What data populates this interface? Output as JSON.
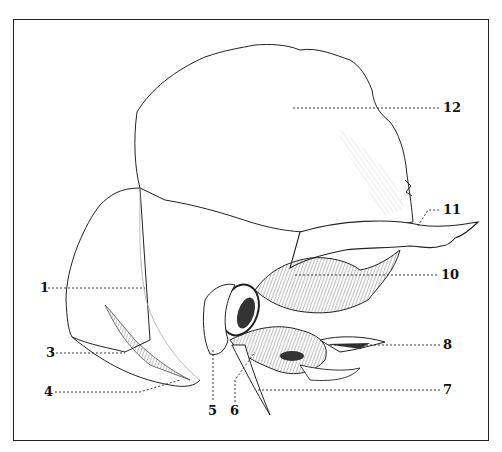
{
  "figure": {
    "frame": true,
    "labels": [
      {
        "id": "1",
        "text": "1",
        "side": "left"
      },
      {
        "id": "3",
        "text": "3",
        "side": "left"
      },
      {
        "id": "4",
        "text": "4",
        "side": "left"
      },
      {
        "id": "5",
        "text": "5",
        "side": "bottom"
      },
      {
        "id": "6",
        "text": "6",
        "side": "bottom"
      },
      {
        "id": "7",
        "text": "7",
        "side": "right"
      },
      {
        "id": "8",
        "text": "8",
        "side": "right"
      },
      {
        "id": "10",
        "text": "10",
        "side": "right"
      },
      {
        "id": "11",
        "text": "11",
        "side": "right"
      },
      {
        "id": "12",
        "text": "12",
        "side": "right"
      }
    ]
  },
  "colors": {
    "ink": "#1a1a1a",
    "shade": "#555555",
    "background": "#ffffff"
  }
}
